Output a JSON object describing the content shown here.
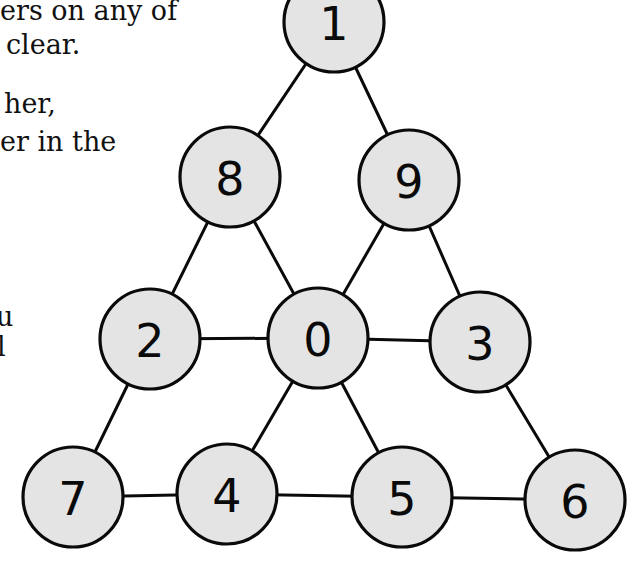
{
  "text_fragments": [
    {
      "id": "line1",
      "text": "ers on any of",
      "x": 0,
      "y": -3
    },
    {
      "id": "line2",
      "text": "clear.",
      "x": 6,
      "y": 31
    },
    {
      "id": "line3",
      "text": "her,",
      "x": 4,
      "y": 90
    },
    {
      "id": "line4",
      "text": "er in the",
      "x": 0,
      "y": 128
    },
    {
      "id": "line5",
      "text": "u",
      "x": -4,
      "y": 303
    },
    {
      "id": "line6",
      "text": "l",
      "x": -3,
      "y": 333
    }
  ],
  "graph": {
    "node_fill": "#e4e4e4",
    "stroke_color": "#0a0a0a",
    "node_radius": 50,
    "nodes": [
      {
        "id": "n1",
        "label": "1",
        "cx": 334,
        "cy": 22
      },
      {
        "id": "n8",
        "label": "8",
        "cx": 230,
        "cy": 177
      },
      {
        "id": "n9",
        "label": "9",
        "cx": 409,
        "cy": 180
      },
      {
        "id": "n2",
        "label": "2",
        "cx": 150,
        "cy": 339
      },
      {
        "id": "n0",
        "label": "0",
        "cx": 318,
        "cy": 338
      },
      {
        "id": "n3",
        "label": "3",
        "cx": 480,
        "cy": 342
      },
      {
        "id": "n7",
        "label": "7",
        "cx": 73,
        "cy": 497
      },
      {
        "id": "n4",
        "label": "4",
        "cx": 227,
        "cy": 494
      },
      {
        "id": "n5",
        "label": "5",
        "cx": 402,
        "cy": 497
      },
      {
        "id": "n6",
        "label": "6",
        "cx": 575,
        "cy": 500
      }
    ],
    "edges": [
      [
        "n1",
        "n8"
      ],
      [
        "n1",
        "n9"
      ],
      [
        "n8",
        "n2"
      ],
      [
        "n8",
        "n0"
      ],
      [
        "n9",
        "n0"
      ],
      [
        "n9",
        "n3"
      ],
      [
        "n2",
        "n0"
      ],
      [
        "n0",
        "n3"
      ],
      [
        "n2",
        "n7"
      ],
      [
        "n0",
        "n4"
      ],
      [
        "n0",
        "n5"
      ],
      [
        "n3",
        "n6"
      ],
      [
        "n7",
        "n4"
      ],
      [
        "n4",
        "n5"
      ],
      [
        "n5",
        "n6"
      ]
    ]
  }
}
